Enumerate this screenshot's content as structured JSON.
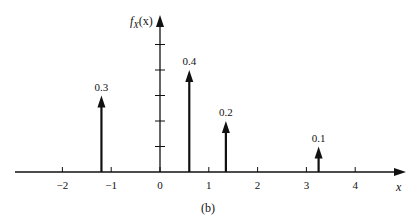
{
  "chart_data": {
    "type": "stem",
    "title": "",
    "caption": "(b)",
    "xlabel": "x",
    "ylabel": "f_X(x)",
    "x": [
      -1.2,
      0.6,
      1.35,
      3.25
    ],
    "values": [
      0.3,
      0.4,
      0.2,
      0.1
    ],
    "value_labels": [
      "0.3",
      "0.4",
      "0.2",
      "0.1"
    ],
    "x_ticks": [
      -2,
      -1,
      0,
      1,
      2,
      3,
      4
    ],
    "x_tick_labels": [
      "−2",
      "−1",
      "0",
      "1",
      "2",
      "3",
      "4"
    ],
    "y_ticks": [
      0.1,
      0.2,
      0.3,
      0.4,
      0.5
    ],
    "y_tick_labels_shown": false,
    "xlim": [
      -3,
      4.9
    ],
    "ylim": [
      0,
      0.6
    ],
    "grid": false,
    "legend": null
  },
  "axes": {
    "y_label_main": "f",
    "y_label_sub": "X",
    "y_label_arg": "(x)",
    "x_label": "x"
  },
  "caption": "(b)"
}
